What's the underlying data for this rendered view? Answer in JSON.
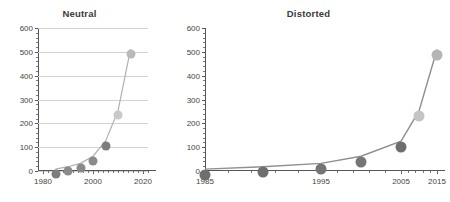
{
  "chart_data": [
    {
      "type": "line",
      "title": "Neutral",
      "xlabel": "",
      "ylabel": "",
      "x": [
        1985,
        1990,
        1995,
        2000,
        2005,
        2010,
        2015
      ],
      "values": [
        8,
        18,
        32,
        62,
        125,
        252,
        510
      ],
      "categories": [
        "1985",
        "1990",
        "1995",
        "2000",
        "2005",
        "2010",
        "2015"
      ],
      "xlim": [
        1978,
        2022
      ],
      "ylim": [
        0,
        600
      ],
      "xticks": [
        1980,
        2000,
        2020
      ],
      "xticklabels": [
        "1980",
        "2000",
        "2020"
      ],
      "yticks": [
        0,
        100,
        200,
        300,
        400,
        500,
        600
      ],
      "yticklabels": [
        "0",
        "100",
        "200",
        "300",
        "400",
        "500",
        "600"
      ],
      "grid": "horizontal",
      "legend": "none",
      "axis_scale": "linear",
      "marker_colors": [
        "#7d7d7d",
        "#8a8a8a",
        "#8a8a8a",
        "#8a8a8a",
        "#7d7d7d",
        "#c9c9c9",
        "#b9b9b9"
      ],
      "line_color": "#b0b0b0"
    },
    {
      "type": "line",
      "title": "Distorted",
      "xlabel": "",
      "ylabel": "",
      "x": [
        1985,
        1990,
        1995,
        2000,
        2005,
        2010,
        2015
      ],
      "values": [
        8,
        18,
        32,
        62,
        125,
        252,
        510
      ],
      "categories": [
        "1985",
        "1990",
        "1995",
        "2000",
        "2005",
        "2010",
        "2015"
      ],
      "xlim": [
        1985,
        2015
      ],
      "ylim": [
        0,
        600
      ],
      "xticks": [
        1985,
        1995,
        2005,
        2015
      ],
      "xticklabels": [
        "1985",
        "1995",
        "2005",
        "2015"
      ],
      "yticks": [
        0,
        100,
        200,
        300,
        400,
        500,
        600
      ],
      "yticklabels": [
        "0",
        "100",
        "200",
        "300",
        "400",
        "500",
        "600"
      ],
      "grid": "none",
      "legend": "none",
      "axis_scale": "nonuniform-compressed-right",
      "marker_colors": [
        "#6e6e6e",
        "#6e6e6e",
        "#757575",
        "#757575",
        "#6e6e6e",
        "#c4c4c4",
        "#b5b5b5"
      ],
      "line_color": "#8f8f8f"
    }
  ],
  "colors": {
    "axis": "#555555",
    "grid": "#d2d2d2",
    "title_text": "#3a3a3a",
    "tick_text": "#444444",
    "background": "#ffffff"
  }
}
